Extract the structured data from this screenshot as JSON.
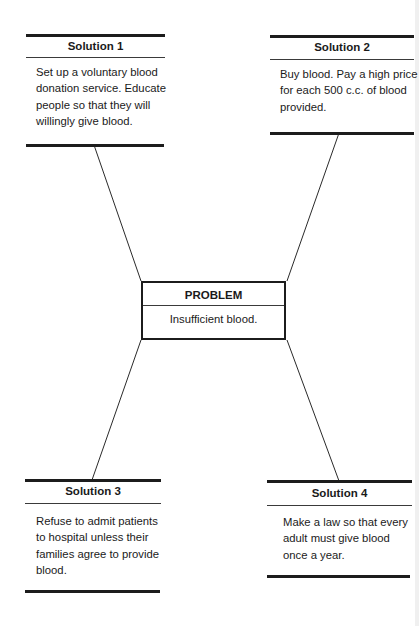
{
  "problem": {
    "heading": "PROBLEM",
    "text": "Insufficient blood."
  },
  "solutions": [
    {
      "heading": "Solution 1",
      "lines": [
        "Set up a voluntary blood",
        "donation service. Educate",
        "people so that they will",
        "willingly give blood."
      ]
    },
    {
      "heading": "Solution 2",
      "lines": [
        "Buy blood. Pay a high price",
        "for each 500 c.c. of blood",
        "provided."
      ]
    },
    {
      "heading": "Solution 3",
      "lines": [
        "Refuse to admit patients",
        "to hospital unless their",
        "families agree to provide",
        "blood."
      ]
    },
    {
      "heading": "Solution 4",
      "lines": [
        "Make a law so that every",
        "adult must give blood",
        "once a year."
      ]
    }
  ],
  "colors": {
    "ink": "#1c1c1c",
    "background": "#ffffff"
  }
}
